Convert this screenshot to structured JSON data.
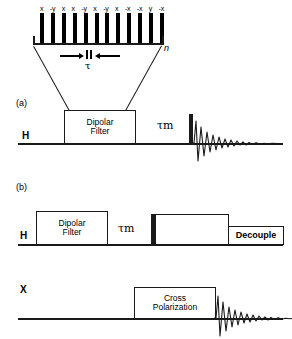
{
  "figure": {
    "type": "nmr-pulse-sequence-diagram",
    "background": "#ffffff",
    "ink": "#000000"
  },
  "pulse_train": {
    "repeat_subscript": "n",
    "interval_label": "τ",
    "pulse_count": 12,
    "phases": [
      "x",
      "-y",
      "x",
      "x",
      "-y",
      "x",
      "-y",
      "x",
      "-x",
      "-x",
      "y",
      "-x"
    ]
  },
  "panel_a": {
    "label": "(a)",
    "channel": "H",
    "filter_box": {
      "line1": "Dipolar",
      "line2": "Filter"
    },
    "mixing_time": {
      "tau": "τ",
      "sub": "m"
    },
    "detection": "fid"
  },
  "panel_b": {
    "label": "(b)",
    "channel_h": "H",
    "channel_x": "X",
    "filter_box": {
      "line1": "Dipolar",
      "line2": "Filter"
    },
    "mixing_time": {
      "tau": "τ",
      "sub": "m"
    },
    "contact_box": "",
    "decouple_box": "Decouple",
    "cp_box": {
      "line1": "Cross",
      "line2": "Polarization"
    },
    "detection": "fid"
  }
}
